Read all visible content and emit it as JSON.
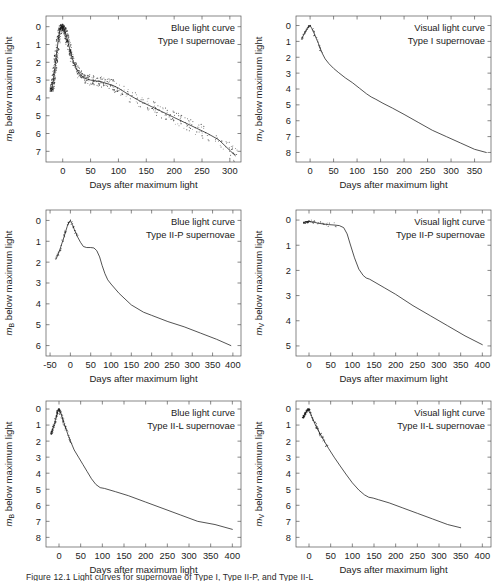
{
  "figure": {
    "caption_partial": "Figure 12.1  Light curves for supernovae of Type I, Type II-P, and Type II-L",
    "axis_title_x": "Days after maximum light",
    "colors": {
      "curve": "#1a1a1a",
      "axis": "#555555",
      "text": "#1c1c1c",
      "background": "#ffffff"
    }
  },
  "chart_data": [
    {
      "id": "panel-blue-type-i",
      "type": "scatter",
      "title": "",
      "annotation_lines": [
        "Blue light curve",
        "Type I supernovae"
      ],
      "xlabel": "Days after maximum light",
      "ylabel": "m_B below maximum light",
      "ylabel_base": "m",
      "ylabel_sub": "B",
      "ylabel_rest": " below maximum light",
      "xlim": [
        -30,
        320
      ],
      "ylim": [
        7.6,
        -0.6
      ],
      "yinvert": true,
      "xticks": [
        0,
        50,
        100,
        150,
        200,
        250,
        300
      ],
      "yticks": [
        0,
        1,
        2,
        3,
        4,
        5,
        6,
        7
      ],
      "grid": false,
      "x": [
        -20,
        -17,
        -14,
        -11,
        -8,
        -6,
        -4,
        -2,
        0,
        2,
        4,
        6,
        8,
        10,
        13,
        16,
        20,
        25,
        30,
        35,
        40,
        50,
        60,
        70,
        80,
        90,
        100,
        120,
        140,
        160,
        180,
        200,
        220,
        240,
        260,
        280,
        300,
        310
      ],
      "values": [
        3.6,
        3.0,
        2.3,
        1.5,
        0.75,
        0.35,
        0.1,
        0.0,
        0.0,
        0.1,
        0.25,
        0.45,
        0.7,
        0.95,
        1.3,
        1.65,
        2.05,
        2.4,
        2.65,
        2.8,
        2.9,
        3.0,
        3.05,
        3.1,
        3.2,
        3.3,
        3.45,
        3.85,
        4.2,
        4.5,
        4.8,
        5.1,
        5.4,
        5.7,
        6.0,
        6.35,
        6.95,
        7.25
      ],
      "scatter_density": "high"
    },
    {
      "id": "panel-visual-type-i",
      "type": "line",
      "title": "",
      "annotation_lines": [
        "Visual light curve",
        "Type I supernovae"
      ],
      "xlabel": "Days after maximum light",
      "ylabel": "m_V below maximum light",
      "ylabel_base": "m",
      "ylabel_sub": "V",
      "ylabel_rest": " below maximum light",
      "xlim": [
        -30,
        385
      ],
      "ylim": [
        8.6,
        -0.6
      ],
      "yinvert": true,
      "xticks": [
        0,
        50,
        100,
        150,
        200,
        250,
        300,
        350
      ],
      "yticks": [
        0,
        1,
        2,
        3,
        4,
        5,
        6,
        7,
        8
      ],
      "grid": false,
      "x": [
        -18,
        -12,
        -6,
        -2,
        0,
        5,
        10,
        18,
        25,
        32,
        40,
        50,
        60,
        75,
        90,
        105,
        120,
        130,
        140,
        155,
        175,
        200,
        230,
        260,
        290,
        320,
        350,
        375
      ],
      "values": [
        0.85,
        0.5,
        0.2,
        0.03,
        0.0,
        0.25,
        0.6,
        1.15,
        1.7,
        2.1,
        2.4,
        2.7,
        2.95,
        3.3,
        3.6,
        3.95,
        4.3,
        4.5,
        4.65,
        4.9,
        5.2,
        5.6,
        6.1,
        6.6,
        7.0,
        7.4,
        7.8,
        8.0
      ],
      "scatter_density": "low"
    },
    {
      "id": "panel-blue-type-ii-p",
      "type": "line",
      "title": "",
      "annotation_lines": [
        "Blue light curve",
        "Type II-P supernovae"
      ],
      "xlabel": "Days after maximum light",
      "ylabel": "m_B below maximum light",
      "ylabel_base": "m",
      "ylabel_sub": "B",
      "ylabel_rest": " below maximum light",
      "xlim": [
        -60,
        420
      ],
      "ylim": [
        6.5,
        -0.5
      ],
      "yinvert": true,
      "xticks": [
        -50,
        0,
        50,
        100,
        150,
        200,
        250,
        300,
        350,
        400
      ],
      "yticks": [
        0,
        1,
        2,
        3,
        4,
        5,
        6
      ],
      "grid": false,
      "x": [
        -35,
        -25,
        -15,
        -8,
        -3,
        0,
        5,
        10,
        18,
        25,
        32,
        40,
        50,
        58,
        65,
        72,
        78,
        85,
        92,
        100,
        120,
        150,
        180,
        200,
        240,
        280,
        320,
        360,
        395
      ],
      "values": [
        1.85,
        1.35,
        0.75,
        0.3,
        0.08,
        0.0,
        0.2,
        0.45,
        0.8,
        1.05,
        1.25,
        1.3,
        1.3,
        1.32,
        1.45,
        1.75,
        2.15,
        2.55,
        2.85,
        3.05,
        3.5,
        4.05,
        4.4,
        4.55,
        4.85,
        5.1,
        5.4,
        5.7,
        6.0
      ],
      "scatter_density": "low"
    },
    {
      "id": "panel-visual-type-ii-p",
      "type": "line",
      "title": "",
      "annotation_lines": [
        "Visual light curve",
        "Type II-P supernovae"
      ],
      "xlabel": "Days after maximum light",
      "ylabel": "m_V below maximum light",
      "ylabel_base": "m",
      "ylabel_sub": "V",
      "ylabel_rest": " below maximum light",
      "xlim": [
        -30,
        420
      ],
      "ylim": [
        5.4,
        -0.4
      ],
      "yinvert": true,
      "xticks": [
        0,
        50,
        100,
        150,
        200,
        250,
        300,
        350,
        400
      ],
      "yticks": [
        0,
        1,
        2,
        3,
        4,
        5
      ],
      "grid": false,
      "x": [
        -12,
        -5,
        0,
        10,
        20,
        30,
        45,
        60,
        70,
        80,
        88,
        95,
        105,
        115,
        125,
        132,
        140,
        150,
        175,
        200,
        240,
        280,
        320,
        360,
        400
      ],
      "values": [
        0.1,
        0.07,
        0.05,
        0.08,
        0.12,
        0.15,
        0.18,
        0.2,
        0.22,
        0.3,
        0.55,
        0.95,
        1.5,
        1.95,
        2.2,
        2.3,
        2.35,
        2.45,
        2.7,
        2.95,
        3.4,
        3.8,
        4.2,
        4.6,
        4.95
      ],
      "scatter_density": "low"
    },
    {
      "id": "panel-blue-type-ii-l",
      "type": "line",
      "title": "",
      "annotation_lines": [
        "Blue light curve",
        "Type II-L supernovae"
      ],
      "xlabel": "Days after maximum light",
      "ylabel": "m_B below maximum light",
      "ylabel_base": "m",
      "ylabel_sub": "B",
      "ylabel_rest": " below maximum light",
      "xlim": [
        -30,
        420
      ],
      "ylim": [
        8.6,
        -0.5
      ],
      "yinvert": true,
      "xticks": [
        0,
        50,
        100,
        150,
        200,
        250,
        300,
        350,
        400
      ],
      "yticks": [
        0,
        1,
        2,
        3,
        4,
        5,
        6,
        7,
        8
      ],
      "grid": false,
      "x": [
        -18,
        -12,
        -6,
        -2,
        0,
        4,
        10,
        18,
        25,
        35,
        45,
        55,
        65,
        75,
        85,
        95,
        105,
        130,
        160,
        200,
        240,
        280,
        320,
        360,
        400
      ],
      "values": [
        1.55,
        1.05,
        0.45,
        0.1,
        0.0,
        0.25,
        0.75,
        1.4,
        1.9,
        2.55,
        3.0,
        3.45,
        3.9,
        4.35,
        4.7,
        4.9,
        4.95,
        5.15,
        5.4,
        5.8,
        6.2,
        6.6,
        7.0,
        7.2,
        7.5
      ],
      "scatter_density": "medium"
    },
    {
      "id": "panel-visual-type-ii-l",
      "type": "line",
      "title": "",
      "annotation_lines": [
        "Visual light curve",
        "Type II-L supernovae"
      ],
      "xlabel": "Days after maximum light",
      "ylabel": "m_V below maximum light",
      "ylabel_base": "m",
      "ylabel_sub": "V",
      "ylabel_rest": " below maximum light",
      "xlim": [
        -30,
        420
      ],
      "ylim": [
        8.6,
        -0.5
      ],
      "yinvert": true,
      "xticks": [
        0,
        50,
        100,
        150,
        200,
        250,
        300,
        350,
        400
      ],
      "yticks": [
        0,
        1,
        2,
        3,
        4,
        5,
        6,
        7,
        8
      ],
      "grid": false,
      "x": [
        -14,
        -8,
        -3,
        0,
        6,
        14,
        22,
        32,
        45,
        58,
        72,
        85,
        100,
        115,
        128,
        138,
        148,
        160,
        185,
        215,
        250,
        285,
        320,
        350
      ],
      "values": [
        0.55,
        0.25,
        0.05,
        0.0,
        0.45,
        0.95,
        1.35,
        1.85,
        2.45,
        3.0,
        3.55,
        4.05,
        4.6,
        5.05,
        5.35,
        5.5,
        5.55,
        5.65,
        5.85,
        6.15,
        6.5,
        6.85,
        7.2,
        7.4
      ],
      "scatter_density": "medium"
    }
  ]
}
